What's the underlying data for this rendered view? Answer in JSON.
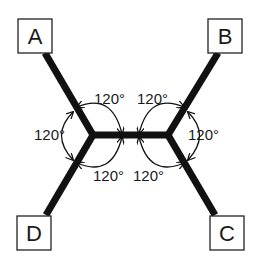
{
  "diagram": {
    "type": "steiner-tree",
    "colors": {
      "stroke": "#111111",
      "background": "#ffffff"
    },
    "nodes": [
      {
        "id": "A",
        "label": "A"
      },
      {
        "id": "B",
        "label": "B"
      },
      {
        "id": "C",
        "label": "C"
      },
      {
        "id": "D",
        "label": "D"
      }
    ],
    "junctions": [
      {
        "id": "J1",
        "connects": [
          "A",
          "D",
          "J2"
        ]
      },
      {
        "id": "J2",
        "connects": [
          "B",
          "C",
          "J1"
        ]
      }
    ],
    "angles": {
      "top_left": "120°",
      "top_right": "120°",
      "left": "120°",
      "right": "120°",
      "bottom_left": "120°",
      "bottom_right": "120°"
    }
  }
}
